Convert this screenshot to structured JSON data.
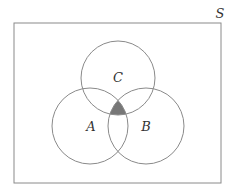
{
  "diagram": {
    "type": "venn",
    "universe": {
      "label": "S",
      "x": 14,
      "y": 23,
      "width": 207,
      "height": 160,
      "label_x": 220,
      "label_y": 18
    },
    "sets": [
      {
        "id": "C",
        "label": "C",
        "cx": 118,
        "cy": 78,
        "r": 37,
        "label_x": 118,
        "label_y": 82
      },
      {
        "id": "A",
        "label": "A",
        "cx": 90,
        "cy": 126,
        "r": 38,
        "label_x": 91,
        "label_y": 131
      },
      {
        "id": "B",
        "label": "B",
        "cx": 146,
        "cy": 126,
        "r": 38,
        "label_x": 146,
        "label_y": 131
      }
    ],
    "shaded_region": "A ∩ B ∩ C",
    "colors": {
      "stroke": "#8a8a8a",
      "shade": "#777777",
      "background": "#ffffff"
    }
  }
}
